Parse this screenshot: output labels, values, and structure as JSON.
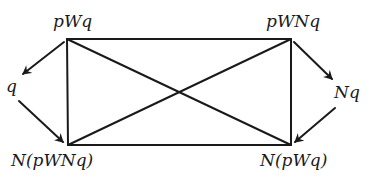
{
  "diagram": {
    "type": "square-of-opposition",
    "nodes": {
      "top_left": {
        "label": "pWq"
      },
      "top_right": {
        "label": "pWNq"
      },
      "left": {
        "label": "q"
      },
      "right": {
        "label": "Nq"
      },
      "bottom_left": {
        "label": "N(pWNq)"
      },
      "bottom_right": {
        "label": "N(pWq)"
      }
    },
    "edges": [
      {
        "from": "pWq",
        "to": "pWNq",
        "kind": "line"
      },
      {
        "from": "N(pWNq)",
        "to": "N(pWq)",
        "kind": "line"
      },
      {
        "from": "pWq",
        "to": "N(pWNq)",
        "kind": "line"
      },
      {
        "from": "pWNq",
        "to": "N(pWq)",
        "kind": "line"
      },
      {
        "from": "pWq",
        "to": "N(pWq)",
        "kind": "line"
      },
      {
        "from": "pWNq",
        "to": "N(pWNq)",
        "kind": "line"
      },
      {
        "from": "pWq",
        "to": "q",
        "kind": "arrow"
      },
      {
        "from": "q",
        "to": "N(pWNq)",
        "kind": "arrow"
      },
      {
        "from": "pWNq",
        "to": "Nq",
        "kind": "arrow"
      },
      {
        "from": "Nq",
        "to": "N(pWq)",
        "kind": "arrow"
      }
    ],
    "colors": {
      "stroke": "#1a1a1a",
      "background": "#ffffff"
    }
  }
}
